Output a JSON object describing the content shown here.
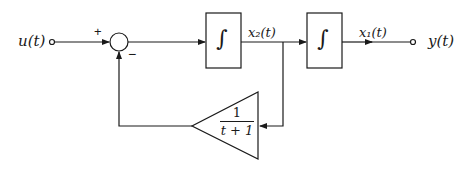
{
  "diagram": {
    "type": "block-diagram",
    "input": {
      "label": "u(t)"
    },
    "output": {
      "label": "y(t)"
    },
    "summing_junction": {
      "plus_sign": "+",
      "minus_sign": "−"
    },
    "blocks": [
      {
        "id": "integrator-1",
        "symbol": "∫"
      },
      {
        "id": "integrator-2",
        "symbol": "∫"
      }
    ],
    "signals": [
      {
        "label": "x₂(t)",
        "between": "integrator-1 → integrator-2"
      },
      {
        "label": "x₁(t)",
        "between": "integrator-2 → output"
      }
    ],
    "feedback_gain": {
      "numerator": "1",
      "denominator": "t + 1"
    },
    "colors": {
      "stroke": "#1a1a1a",
      "background": "#ffffff"
    }
  }
}
